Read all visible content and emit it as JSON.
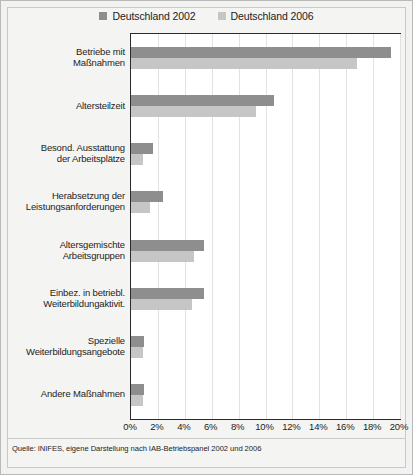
{
  "legend": {
    "position": "top-center",
    "entries": [
      {
        "label": "Deutschland 2002",
        "color": "#8e8e8e",
        "swatch_name": "legend-swatch-2002"
      },
      {
        "label": "Deutschland 2006",
        "color": "#c6c6c6",
        "swatch_name": "legend-swatch-2006"
      }
    ]
  },
  "source": {
    "text": "Quelle: INIFES, eigene Darstellung nach IAB-Betriebspanel 2002 und 2006"
  },
  "axis": {
    "xticks": [
      "0%",
      "2%",
      "4%",
      "6%",
      "8%",
      "10%",
      "12%",
      "14%",
      "16%",
      "18%",
      "20%"
    ]
  },
  "chart_data": {
    "type": "bar",
    "orientation": "horizontal",
    "title": "",
    "subtitle": "",
    "xlabel": "",
    "ylabel": "",
    "xlim": [
      0,
      20
    ],
    "xticks": [
      0,
      2,
      4,
      6,
      8,
      10,
      12,
      14,
      16,
      18,
      20
    ],
    "xtick_labels": [
      "0%",
      "2%",
      "4%",
      "6%",
      "8%",
      "10%",
      "12%",
      "14%",
      "16%",
      "18%",
      "20%"
    ],
    "grid": true,
    "grid_axis": "x",
    "legend_position": "top-center",
    "value_unit": "%",
    "categories": [
      [
        "Betriebe mit",
        "Maßnahmen"
      ],
      [
        "Altersteilzeit"
      ],
      [
        "Besond. Ausstattung",
        "der Arbeitsplätze"
      ],
      [
        "Herabsetzung der",
        "Leistungsanforderungen"
      ],
      [
        "Altersgemischte",
        "Arbeitsgruppen"
      ],
      [
        "Einbez. in betriebl.",
        "Weiterbildungaktivit."
      ],
      [
        "Spezielle",
        "Weiterbildungsangebote"
      ],
      [
        "Andere Maßnahmen"
      ]
    ],
    "series": [
      {
        "name": "Deutschland 2002",
        "color": "#8e8e8e",
        "values": [
          19.3,
          10.6,
          1.6,
          2.4,
          5.4,
          5.4,
          1.0,
          1.0
        ]
      },
      {
        "name": "Deutschland 2006",
        "color": "#c6c6c6",
        "values": [
          16.8,
          9.3,
          0.9,
          1.4,
          4.7,
          4.5,
          0.9,
          0.9
        ]
      }
    ]
  }
}
